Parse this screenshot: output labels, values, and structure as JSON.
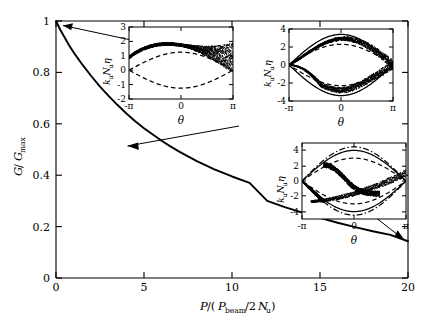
{
  "figure": {
    "width": 432,
    "height": 335,
    "background": "#ffffff",
    "ink": "#000000"
  },
  "chart_data": {
    "type": "line",
    "title": "",
    "xlabel": "P/(P_beam/2N_u)",
    "ylabel": "G/G_max",
    "xlim": [
      0,
      20
    ],
    "ylim": [
      0,
      1
    ],
    "grid": false,
    "legend": "none",
    "xticks": [
      "0",
      "5",
      "10",
      "15",
      "20"
    ],
    "xtick_values": [
      0,
      5,
      10,
      15,
      20
    ],
    "yticks": [
      "0",
      "0.2",
      "0.4",
      "0.6",
      "0.8",
      "1"
    ],
    "ytick_values": [
      0,
      0.2,
      0.4,
      0.6,
      0.8,
      1
    ],
    "series": [
      {
        "name": "G/Gmax vs normalized power",
        "style": "solid",
        "x": [
          0,
          0.25,
          0.5,
          0.75,
          1.0,
          1.5,
          2.0,
          2.5,
          3.0,
          3.5,
          4.0,
          4.5,
          5.0,
          5.5,
          6.0,
          6.5,
          7.0,
          7.5,
          8.0,
          9.0,
          10.0,
          11.0,
          12.0,
          13.0,
          14.0,
          15.0,
          16.0,
          17.0,
          18.0,
          19.0,
          20.0
        ],
        "y": [
          1.0,
          0.965,
          0.935,
          0.905,
          0.878,
          0.83,
          0.786,
          0.745,
          0.708,
          0.673,
          0.64,
          0.61,
          0.583,
          0.558,
          0.534,
          0.512,
          0.492,
          0.473,
          0.455,
          0.423,
          0.395,
          0.37,
          0.3,
          0.276,
          0.254,
          0.234,
          0.215,
          0.198,
          0.182,
          0.168,
          0.143
        ]
      }
    ],
    "annotations": [
      {
        "name": "arrow-to-inset-1",
        "from_xy": [
          4.4,
          0.925
        ],
        "to_xy": [
          0.15,
          0.99
        ]
      },
      {
        "name": "arrow-to-inset-2",
        "from_xy": [
          10.4,
          0.59
        ],
        "to_xy": [
          4.05,
          0.515
        ]
      },
      {
        "name": "arrow-to-inset-3",
        "from_xy": [
          18.9,
          0.3
        ],
        "to_xy": [
          19.9,
          0.145
        ]
      }
    ],
    "insets": [
      {
        "id": "inset-1",
        "xlabel": "theta",
        "ylabel": "k_u N_u eta",
        "xticks": [
          "-π",
          "0",
          "π"
        ],
        "yticks": [
          "-2",
          "-1",
          "0",
          "1",
          "2",
          "3"
        ],
        "ylim": [
          -2,
          3
        ],
        "xlim": [
          -3.14159,
          3.14159
        ],
        "curves": [
          {
            "name": "separatrix",
            "style": "dashed"
          },
          {
            "name": "particle-bunch",
            "style": "scatter"
          }
        ]
      },
      {
        "id": "inset-2",
        "xlabel": "theta",
        "ylabel": "k_u N_u eta",
        "xticks": [
          "-π",
          "0",
          "π"
        ],
        "yticks": [
          "-4",
          "-2",
          "0",
          "2",
          "4"
        ],
        "ylim": [
          -4,
          4
        ],
        "xlim": [
          -3.14159,
          3.14159
        ],
        "curves": [
          {
            "name": "separatrix",
            "style": "dashed"
          },
          {
            "name": "outer-separatrix",
            "style": "solid"
          },
          {
            "name": "particle-bunch",
            "style": "scatter"
          }
        ]
      },
      {
        "id": "inset-3",
        "xlabel": "theta",
        "ylabel": "k_u N_u eta",
        "xticks": [
          "-π",
          "0",
          "π"
        ],
        "yticks": [
          "-4",
          "-2",
          "0",
          "2",
          "4"
        ],
        "ylim": [
          -5.4,
          5.4
        ],
        "xlim": [
          -3.14159,
          3.14159
        ],
        "curves": [
          {
            "name": "separatrix",
            "style": "dashed"
          },
          {
            "name": "outer-separatrix",
            "style": "dash-dot"
          },
          {
            "name": "mid-separatrix",
            "style": "solid"
          },
          {
            "name": "particle-bunch",
            "style": "scatter"
          }
        ]
      }
    ]
  },
  "axis_labels": {
    "x_main_prefix": "P",
    "x_main_paren_open": "/(",
    "x_main_P": "P",
    "x_main_beam_sub": "beam",
    "x_main_slash2": "/2",
    "x_main_N": "N",
    "x_main_u_sub": "u",
    "x_main_paren_close": ")",
    "y_main_G": "G",
    "y_main_slash": "/",
    "y_main_G2": "G",
    "y_main_max_sub": "max",
    "inset_y_k": "k",
    "inset_y_u1": "u",
    "inset_y_N": "N",
    "inset_y_u2": "u",
    "inset_y_eta": "η",
    "inset_x_theta": "θ"
  }
}
